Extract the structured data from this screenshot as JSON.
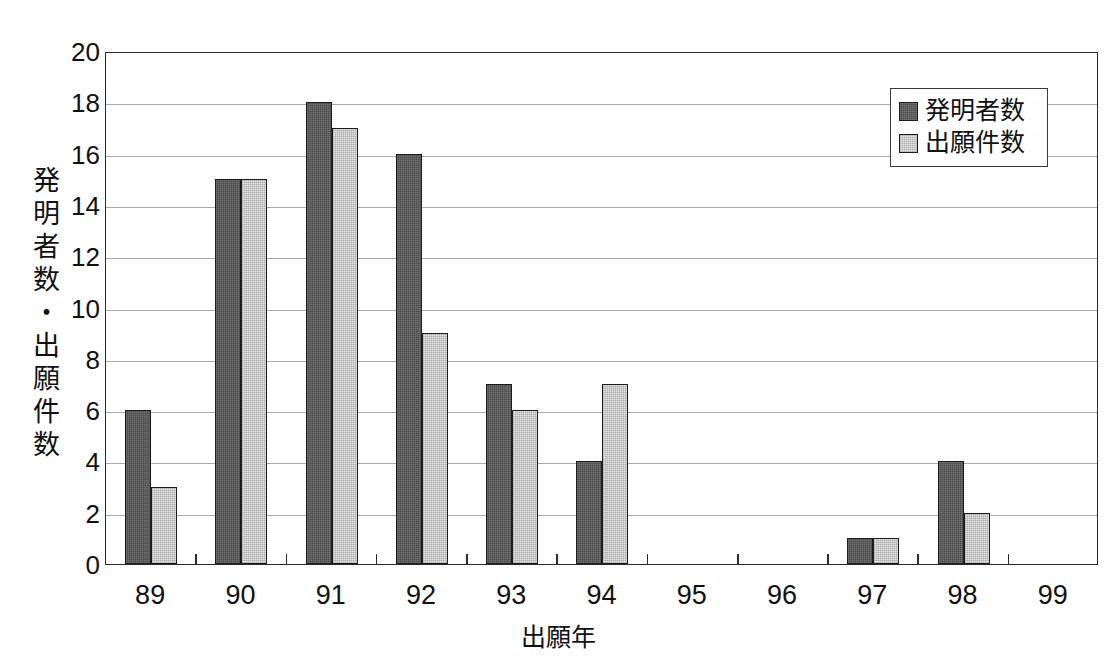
{
  "chart_data": {
    "type": "bar",
    "title": "",
    "subtitle": "",
    "xlabel": "出願年",
    "ylabel": "発明者数・出願件数",
    "categories": [
      "89",
      "90",
      "91",
      "92",
      "93",
      "94",
      "95",
      "96",
      "97",
      "98",
      "99"
    ],
    "series": [
      {
        "name": "発明者数",
        "swatch": "dark-hatch",
        "color": "#4d4d4d",
        "values": [
          6,
          15,
          18,
          16,
          7,
          4,
          0,
          0,
          1,
          4,
          0
        ]
      },
      {
        "name": "出願件数",
        "swatch": "light-hatch",
        "color": "#e4e4e4",
        "values": [
          3,
          15,
          17,
          9,
          6,
          7,
          0,
          0,
          1,
          2,
          0
        ]
      }
    ],
    "ylim": [
      0,
      20
    ],
    "ytick_step": 2,
    "yticks": [
      "20",
      "18",
      "16",
      "14",
      "12",
      "10",
      "8",
      "6",
      "4",
      "2",
      "0"
    ],
    "grid": true,
    "grid_axis": "y",
    "legend_position": "top-right",
    "bar_border_color": "#1c1c1c",
    "axis_color": "#2b2b2b",
    "gridline_color": "#8d8d8d",
    "background": "#ffffff"
  },
  "legend": {
    "items": [
      {
        "label": "発明者数"
      },
      {
        "label": "出願件数"
      }
    ]
  },
  "axes": {
    "y_title_chars": "発\n明\n者\n数\n・\n出\n願\n件\n数",
    "x_title": "出願年"
  }
}
